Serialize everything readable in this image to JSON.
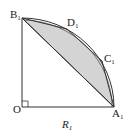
{
  "figure": {
    "type": "geometry-diagram",
    "colors": {
      "stroke": "#333333",
      "fill": "#d4d4d4",
      "background": "#ffffff"
    },
    "points": {
      "O": {
        "label": "O",
        "sub": "",
        "x": 22,
        "y": 107
      },
      "A1": {
        "label": "A",
        "sub": "1",
        "x": 114,
        "y": 107
      },
      "B1": {
        "label": "B",
        "sub": "1",
        "x": 22,
        "y": 18
      },
      "C1": {
        "label": "C",
        "sub": "1",
        "x": 102,
        "y": 61
      },
      "D1": {
        "label": "D",
        "sub": "1",
        "x": 67,
        "y": 29
      }
    },
    "radius_label": {
      "label": "R",
      "sub": "1"
    },
    "right_angle_at": "O"
  }
}
